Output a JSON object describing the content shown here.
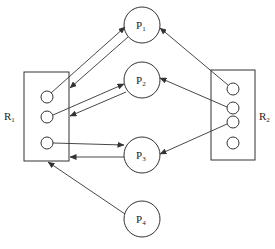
{
  "diagram": {
    "type": "resource-allocation-graph",
    "processes": [
      {
        "id": "P1",
        "label": "P",
        "sub": "1"
      },
      {
        "id": "P2",
        "label": "P",
        "sub": "2"
      },
      {
        "id": "P3",
        "label": "P",
        "sub": "3"
      },
      {
        "id": "P4",
        "label": "P",
        "sub": "4"
      }
    ],
    "resources": [
      {
        "id": "R1",
        "label": "R",
        "sub": "1",
        "instances": 3
      },
      {
        "id": "R2",
        "label": "R",
        "sub": "2",
        "instances": 4
      }
    ],
    "edges": [
      {
        "from": "R1.instance1",
        "to": "P1",
        "kind": "assignment"
      },
      {
        "from": "P1",
        "to": "R1",
        "kind": "request"
      },
      {
        "from": "R1.instance2",
        "to": "P2",
        "kind": "assignment"
      },
      {
        "from": "P2",
        "to": "R1",
        "kind": "request"
      },
      {
        "from": "R1.instance3",
        "to": "P3",
        "kind": "assignment"
      },
      {
        "from": "P3",
        "to": "R1",
        "kind": "request"
      },
      {
        "from": "P4",
        "to": "R1",
        "kind": "request"
      },
      {
        "from": "R2.instance1",
        "to": "P1",
        "kind": "assignment"
      },
      {
        "from": "R2.instance2",
        "to": "P2",
        "kind": "assignment"
      },
      {
        "from": "R2.instance3",
        "to": "P3",
        "kind": "assignment"
      }
    ],
    "colors": {
      "stroke": "#333333",
      "background": "#ffffff"
    }
  }
}
